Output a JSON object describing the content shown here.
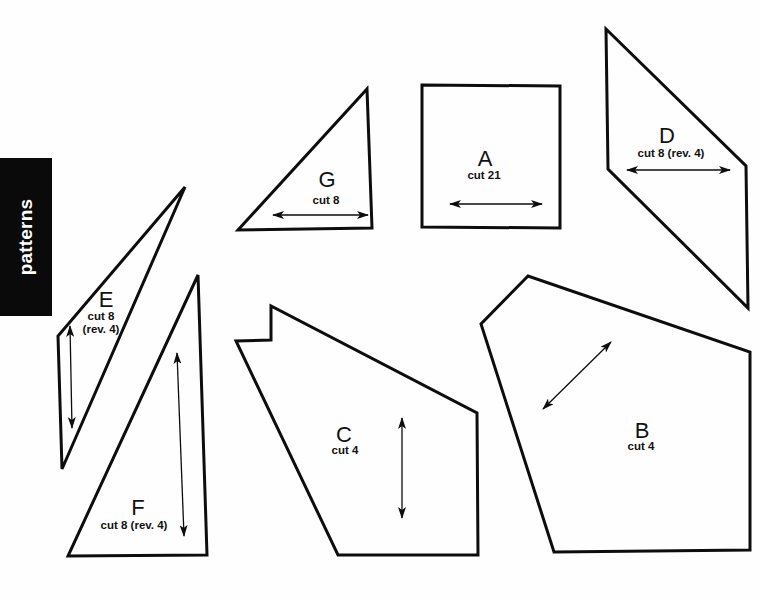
{
  "sidebar_tab": {
    "label": "patterns",
    "background": "#0a0a0a",
    "text_color": "#ffffff"
  },
  "pieces": {
    "A": {
      "letter": "A",
      "cut": "cut 21"
    },
    "B": {
      "letter": "B",
      "cut": "cut 4"
    },
    "C": {
      "letter": "C",
      "cut": "cut 4"
    },
    "D": {
      "letter": "D",
      "cut": "cut 8 (rev. 4)"
    },
    "E": {
      "letter": "E",
      "cut_line1": "cut 8",
      "cut_line2": "(rev. 4)"
    },
    "F": {
      "letter": "F",
      "cut": "cut 8 (rev. 4)"
    },
    "G": {
      "letter": "G",
      "cut": "cut 8"
    }
  },
  "colors": {
    "line": "#0d0d0d",
    "paper": "#fefefe"
  }
}
